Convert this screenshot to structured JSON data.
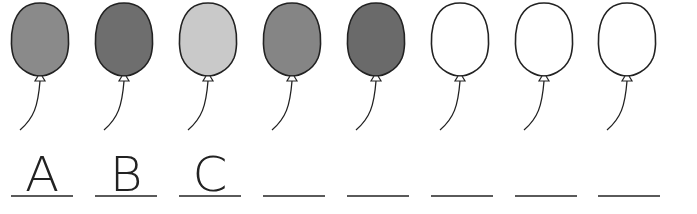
{
  "worksheet": {
    "balloons": [
      {
        "fill": "#8a8a8a",
        "letter": "A"
      },
      {
        "fill": "#6e6e6e",
        "letter": "B"
      },
      {
        "fill": "#c9c9c9",
        "letter": "C"
      },
      {
        "fill": "#858585",
        "letter": ""
      },
      {
        "fill": "#6a6a6a",
        "letter": ""
      },
      {
        "fill": "#ffffff",
        "letter": ""
      },
      {
        "fill": "#ffffff",
        "letter": ""
      },
      {
        "fill": "#ffffff",
        "letter": ""
      }
    ],
    "outline_color": "#222222",
    "underline_color": "#5a5a5a"
  }
}
